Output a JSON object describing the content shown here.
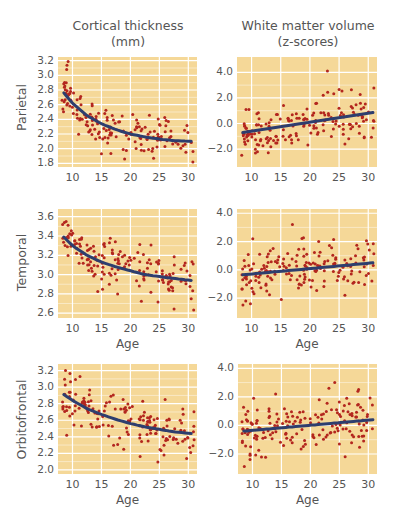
{
  "columns": [
    {
      "title_line1": "Cortical thickness",
      "title_line2": "(mm)"
    },
    {
      "title_line1": "White matter volume",
      "title_line2": "(z-scores)"
    }
  ],
  "rows": [
    {
      "label": "Parietal"
    },
    {
      "label": "Temporal"
    },
    {
      "label": "Orbitofrontal"
    }
  ],
  "colors": {
    "plot_background": "#f5d898",
    "grid": "#ffffff",
    "points": "#b3261e",
    "fit_line": "#2e3e6e"
  },
  "chart_data": [
    {
      "id": "parietal-thickness",
      "type": "scatter",
      "row": "Parietal",
      "column": "Cortical thickness (mm)",
      "xlabel": "",
      "ylabel": "Parietal",
      "xlim": [
        7.5,
        31.5
      ],
      "ylim": [
        1.75,
        3.25
      ],
      "xticks": [
        10,
        15,
        20,
        25,
        30
      ],
      "yticks": [
        "3.2",
        "3.0",
        "2.8",
        "2.6",
        "2.4",
        "2.2",
        "2.0",
        "1.8"
      ],
      "ytick_values": [
        3.2,
        3.0,
        2.8,
        2.6,
        2.4,
        2.2,
        2.0,
        1.8
      ],
      "fit": {
        "kind": "exponential",
        "points": [
          [
            8.5,
            2.76
          ],
          [
            10,
            2.62
          ],
          [
            12.5,
            2.45
          ],
          [
            15,
            2.34
          ],
          [
            17.5,
            2.26
          ],
          [
            20,
            2.2
          ],
          [
            22.5,
            2.16
          ],
          [
            25,
            2.13
          ],
          [
            27.5,
            2.11
          ],
          [
            30.5,
            2.1
          ]
        ]
      },
      "n_points": 160,
      "noise": 0.14,
      "seed": 11,
      "outliers": [
        [
          9,
          3.08
        ],
        [
          15,
          1.93
        ],
        [
          19,
          1.86
        ],
        [
          24,
          1.87
        ]
      ]
    },
    {
      "id": "parietal-whitematter",
      "type": "scatter",
      "row": "Parietal",
      "column": "White matter volume (z-scores)",
      "xlabel": "",
      "ylabel": "",
      "xlim": [
        7.5,
        31.5
      ],
      "ylim": [
        -3.4,
        5.2
      ],
      "xticks": [
        10,
        15,
        20,
        25,
        30
      ],
      "yticks": [
        "4.0",
        "2.0",
        "0.0",
        "−2.0"
      ],
      "ytick_values": [
        4.0,
        2.0,
        0.0,
        -2.0
      ],
      "fit": {
        "kind": "linear",
        "points": [
          [
            8.5,
            -0.7
          ],
          [
            30.8,
            0.85
          ]
        ]
      },
      "n_points": 170,
      "noise": 0.85,
      "seed": 23,
      "outliers": [
        [
          23,
          4.1
        ],
        [
          11,
          -2.2
        ],
        [
          26,
          -1.6
        ]
      ]
    },
    {
      "id": "temporal-thickness",
      "type": "scatter",
      "row": "Temporal",
      "column": "Cortical thickness (mm)",
      "xlabel": "Age",
      "ylabel": "Temporal",
      "xlim": [
        7.5,
        31.5
      ],
      "ylim": [
        2.55,
        3.68
      ],
      "xticks": [
        10,
        15,
        20,
        25,
        30
      ],
      "yticks": [
        "3.6",
        "3.4",
        "3.2",
        "3.0",
        "2.8",
        "2.6"
      ],
      "ytick_values": [
        3.6,
        3.4,
        3.2,
        3.0,
        2.8,
        2.6
      ],
      "fit": {
        "kind": "exponential",
        "points": [
          [
            8.5,
            3.39
          ],
          [
            10,
            3.3
          ],
          [
            12.5,
            3.2
          ],
          [
            15,
            3.13
          ],
          [
            17.5,
            3.08
          ],
          [
            20,
            3.04
          ],
          [
            22.5,
            3.0
          ],
          [
            25,
            2.98
          ],
          [
            27.5,
            2.96
          ],
          [
            30.5,
            2.94
          ]
        ]
      },
      "n_points": 160,
      "noise": 0.13,
      "seed": 37,
      "outliers": [
        [
          8.3,
          3.52
        ],
        [
          8.6,
          3.54
        ],
        [
          8.9,
          3.55
        ],
        [
          17.8,
          2.8
        ],
        [
          30.5,
          2.75
        ]
      ]
    },
    {
      "id": "temporal-whitematter",
      "type": "scatter",
      "row": "Temporal",
      "column": "White matter volume (z-scores)",
      "xlabel": "Age",
      "ylabel": "",
      "xlim": [
        7.5,
        31.5
      ],
      "ylim": [
        -3.4,
        4.3
      ],
      "xticks": [
        10,
        15,
        20,
        25,
        30
      ],
      "yticks": [
        "4.0",
        "2.0",
        "0.0",
        "−2.0"
      ],
      "ytick_values": [
        4.0,
        2.0,
        0.0,
        -2.0
      ],
      "fit": {
        "kind": "linear",
        "points": [
          [
            8.5,
            -0.35
          ],
          [
            30.8,
            0.5
          ]
        ]
      },
      "n_points": 170,
      "noise": 0.85,
      "seed": 41,
      "outliers": [
        [
          17,
          3.2
        ],
        [
          9.8,
          -2.4
        ],
        [
          9,
          -2.2
        ],
        [
          10.2,
          2.2
        ],
        [
          26,
          -1.8
        ]
      ]
    },
    {
      "id": "orbitofrontal-thickness",
      "type": "scatter",
      "row": "Orbitofrontal",
      "column": "Cortical thickness (mm)",
      "xlabel": "Age",
      "ylabel": "Orbitofrontal",
      "xlim": [
        7.5,
        31.5
      ],
      "ylim": [
        1.95,
        3.28
      ],
      "xticks": [
        10,
        15,
        20,
        25,
        30
      ],
      "yticks": [
        "3.2",
        "3.0",
        "2.8",
        "2.6",
        "2.4",
        "2.2",
        "2.0"
      ],
      "ytick_values": [
        3.2,
        3.0,
        2.8,
        2.6,
        2.4,
        2.2,
        2.0
      ],
      "fit": {
        "kind": "exponential",
        "points": [
          [
            8.5,
            2.91
          ],
          [
            10,
            2.84
          ],
          [
            12.5,
            2.74
          ],
          [
            15,
            2.67
          ],
          [
            17.5,
            2.61
          ],
          [
            20,
            2.56
          ],
          [
            22.5,
            2.52
          ],
          [
            25,
            2.49
          ],
          [
            27.5,
            2.46
          ],
          [
            30.5,
            2.44
          ]
        ]
      },
      "n_points": 160,
      "noise": 0.14,
      "seed": 53,
      "outliers": [
        [
          8.8,
          3.2
        ],
        [
          11.3,
          3.13
        ],
        [
          9,
          2.42
        ],
        [
          25.8,
          2.18
        ],
        [
          26,
          2.85
        ]
      ]
    },
    {
      "id": "orbitofrontal-whitematter",
      "type": "scatter",
      "row": "Orbitofrontal",
      "column": "White matter volume (z-scores)",
      "xlabel": "Age",
      "ylabel": "",
      "xlim": [
        7.5,
        31.5
      ],
      "ylim": [
        -3.4,
        4.3
      ],
      "xticks": [
        10,
        15,
        20,
        25,
        30
      ],
      "yticks": [
        "4.0",
        "2.0",
        "0.0",
        "−2.0"
      ],
      "ytick_values": [
        4.0,
        2.0,
        0.0,
        -2.0
      ],
      "fit": {
        "kind": "linear",
        "points": [
          [
            8.5,
            -0.4
          ],
          [
            30.8,
            0.4
          ]
        ]
      },
      "n_points": 170,
      "noise": 0.85,
      "seed": 67,
      "outliers": [
        [
          24.2,
          3.0
        ],
        [
          23.2,
          2.6
        ],
        [
          28.2,
          2.4
        ],
        [
          26,
          -2.2
        ],
        [
          10.2,
          1.9
        ],
        [
          14,
          2.2
        ]
      ]
    }
  ]
}
